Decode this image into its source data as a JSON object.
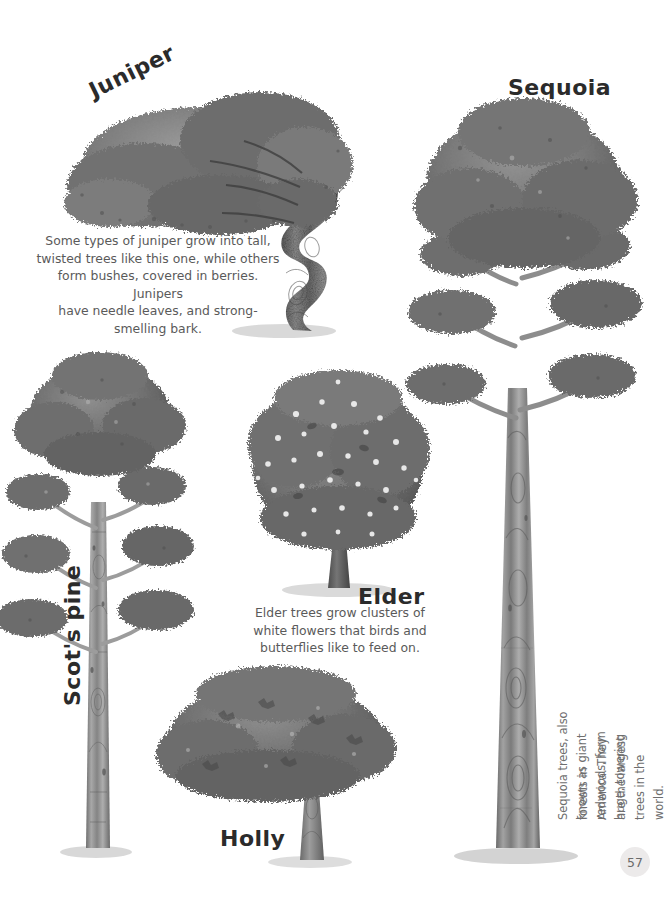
{
  "page": {
    "number": "57",
    "background_color": "#ffffff",
    "ink_color": "#2b2b2b",
    "caption_color": "#5a5a5a"
  },
  "trees": {
    "juniper": {
      "label": "Juniper",
      "caption": "Some types of juniper grow into tall,\ntwisted trees like this one, while others\nform bushes, covered in berries. Junipers\nhave needle leaves, and strong-smelling bark."
    },
    "sequoia": {
      "label": "Sequoia",
      "caption_line1": "Sequoia trees, also known as giant redwoods, form huge, towering",
      "caption_line2": "forests in America. They are the largest trees in the world."
    },
    "scots_pine": {
      "label": "Scot's pine"
    },
    "elder": {
      "label": "Elder",
      "caption": "Elder trees grow clusters of\nwhite flowers that birds and\nbutterflies like to feed on."
    },
    "holly": {
      "label": "Holly"
    }
  }
}
